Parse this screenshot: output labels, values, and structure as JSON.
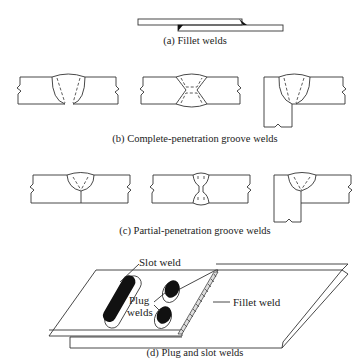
{
  "figure": {
    "captions": {
      "a": "(a) Fillet welds",
      "b": "(b) Complete-penetration groove welds",
      "c": "(c) Partial-penetration groove welds",
      "d": "(d) Plug and slot welds"
    },
    "labels": {
      "slot_weld": "Slot weld",
      "plug": "Plug",
      "welds": "welds",
      "fillet_weld": "Fillet weld"
    },
    "colors": {
      "line": "#333333",
      "fill_weld": "#111111",
      "background": "#ffffff"
    }
  }
}
